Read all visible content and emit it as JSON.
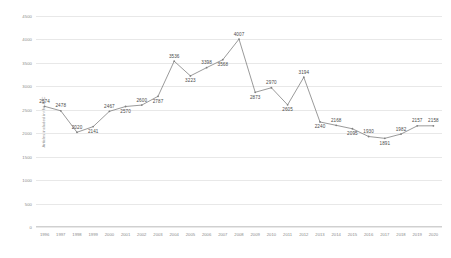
{
  "chart_data": {
    "type": "line",
    "title": "",
    "xlabel": "",
    "ylabel": "Articles included in the ATC",
    "ylim": [
      0,
      4500
    ],
    "ytick_labels": [
      "4500",
      "4000",
      "3500",
      "3000",
      "2500",
      "2000",
      "1500",
      "1000",
      "500",
      "0"
    ],
    "ytick_values": [
      4500,
      4000,
      3500,
      3000,
      2500,
      2000,
      1500,
      1000,
      500,
      0
    ],
    "grid": true,
    "legend": "none",
    "categories": [
      "1996",
      "1997",
      "1998",
      "1999",
      "2000",
      "2001",
      "2002",
      "2003",
      "2004",
      "2005",
      "2006",
      "2007",
      "2008",
      "2009",
      "2010",
      "2011",
      "2012",
      "2013",
      "2014",
      "2015",
      "2016",
      "2017",
      "2018",
      "2019",
      "2020"
    ],
    "values": [
      2574,
      2478,
      2020,
      2141,
      2467,
      2570,
      2600,
      2787,
      3536,
      3223,
      3398,
      3568,
      4007,
      2873,
      2970,
      2605,
      3194,
      2240,
      2168,
      2095,
      1930,
      1891,
      1982,
      2157,
      2158
    ],
    "data_labels": [
      "2574",
      "2478",
      "2020",
      "2141",
      "2467",
      "2570",
      "2600",
      "2787",
      "3536",
      "3223",
      "3398",
      "3568",
      "4007",
      "2873",
      "2970",
      "2605",
      "3194",
      "2240",
      "2168",
      "2095",
      "1930",
      "1891",
      "1982",
      "2157",
      "2158"
    ],
    "label_placement": [
      "above",
      "above",
      "above",
      "below",
      "above",
      "below",
      "above",
      "below",
      "above",
      "below",
      "above",
      "below",
      "above",
      "below",
      "above",
      "below",
      "above",
      "below",
      "above",
      "below",
      "above",
      "below",
      "above",
      "above",
      "above"
    ],
    "line_color": "#808080",
    "grid_color": "#e8e8e8",
    "text_color": "#8a8a8a",
    "label_color": "#4a4a4a",
    "background_color": "#ffffff"
  }
}
